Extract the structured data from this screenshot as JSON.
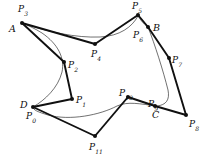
{
  "figure": {
    "width": 205,
    "height": 159,
    "background": "#ffffff",
    "stroke_color": "#101010",
    "control_polygon_width": 1.9,
    "spline_width": 0.6,
    "vertex_radius": 2.0
  },
  "control_points": [
    {
      "id": "P0",
      "label": "P",
      "sub": "0",
      "x": 33.0,
      "y": 107.0,
      "label_x": 26.0,
      "label_y": 112.0
    },
    {
      "id": "P1",
      "label": "P",
      "sub": "1",
      "x": 72.0,
      "y": 99.0,
      "label_x": 76.0,
      "label_y": 96.0
    },
    {
      "id": "P2",
      "label": "P",
      "sub": "2",
      "x": 64.0,
      "y": 62.0,
      "label_x": 68.0,
      "label_y": 61.0
    },
    {
      "id": "P3",
      "label": "P",
      "sub": "3",
      "x": 22.0,
      "y": 23.0,
      "label_x": 18.0,
      "label_y": 5.0
    },
    {
      "id": "P4",
      "label": "P",
      "sub": "4",
      "x": 95.0,
      "y": 44.0,
      "label_x": 91.0,
      "label_y": 50.0
    },
    {
      "id": "P5",
      "label": "P",
      "sub": "5",
      "x": 138.0,
      "y": 15.0,
      "label_x": 132.0,
      "label_y": 2.0
    },
    {
      "id": "P6",
      "label": "P",
      "sub": "6",
      "x": 148.0,
      "y": 27.0,
      "label_x": 133.0,
      "label_y": 31.0
    },
    {
      "id": "P7",
      "label": "P",
      "sub": "7",
      "x": 169.0,
      "y": 58.0,
      "label_x": 172.0,
      "label_y": 56.0
    },
    {
      "id": "P8",
      "label": "P",
      "sub": "8",
      "x": 186.0,
      "y": 115.0,
      "label_x": 189.0,
      "label_y": 120.0
    },
    {
      "id": "P9",
      "label": "P",
      "sub": "9",
      "x": 155.0,
      "y": 106.0,
      "label_x": 148.0,
      "label_y": 100.0
    },
    {
      "id": "P10",
      "label": "P",
      "sub": "10",
      "x": 128.0,
      "y": 97.0,
      "label_x": 119.0,
      "label_y": 89.0
    },
    {
      "id": "P11",
      "label": "P",
      "sub": "11",
      "x": 95.0,
      "y": 136.0,
      "label_x": 89.0,
      "label_y": 143.0
    }
  ],
  "knot_points": [
    {
      "id": "A",
      "label": "A",
      "x": 22.0,
      "y": 23.0,
      "label_x": 9.0,
      "label_y": 24.0
    },
    {
      "id": "B",
      "label": "B",
      "x": 148.0,
      "y": 27.0,
      "label_x": 153.0,
      "label_y": 23.0
    },
    {
      "id": "C",
      "label": "C",
      "x": 155.0,
      "y": 106.0,
      "label_x": 152.0,
      "label_y": 110.0
    },
    {
      "id": "D",
      "label": "D",
      "x": 33.0,
      "y": 107.0,
      "label_x": 20.0,
      "label_y": 100.0
    }
  ],
  "control_polygon_segments": [
    {
      "from": "P3",
      "to": "P4"
    },
    {
      "from": "P4",
      "to": "P5"
    },
    {
      "from": "P5",
      "to": "P6"
    },
    {
      "from": "P6",
      "to": "P7"
    },
    {
      "from": "P7",
      "to": "P8"
    },
    {
      "from": "P8",
      "to": "P9"
    },
    {
      "from": "P9",
      "to": "P10"
    },
    {
      "from": "P10",
      "to": "P11"
    },
    {
      "from": "P11",
      "to": "P0"
    },
    {
      "from": "P0",
      "to": "P1"
    },
    {
      "from": "P1",
      "to": "P2"
    },
    {
      "from": "P2",
      "to": "P3"
    }
  ],
  "spline_path": "M 22 23 C 48 32, 76 38, 100 37 C 120 36, 132 27, 138 16 C 143 24, 147 26, 148 27 C 155 45, 163 70, 168 90 C 170 100, 166 105, 157 106 C 140 104, 128 101, 117 106 C 100 115, 70 121, 48 115 C 38 112, 33 110, 33 107 C 45 100, 58 88, 62 72 C 65 58, 58 44, 42 33 C 34 28, 27 25, 22 23 Z"
}
